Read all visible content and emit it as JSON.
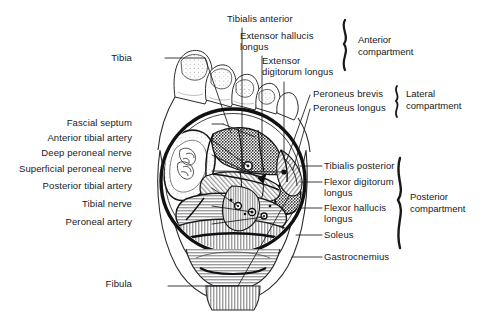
{
  "figure": {
    "type": "anatomical-cross-section",
    "background_color": "#ffffff",
    "ink_color": "#18181a"
  },
  "labels_left": [
    {
      "id": "tibia",
      "text": "Tibia",
      "x": 132,
      "y": 57
    },
    {
      "id": "fascial-septum",
      "text": "Fascial septum",
      "x": 135,
      "y": 122
    },
    {
      "id": "anterior-tibial-artery",
      "text": "Anterior tibial artery",
      "x": 135,
      "y": 137
    },
    {
      "id": "deep-peroneal-nerve",
      "text": "Deep peroneal nerve",
      "x": 135,
      "y": 152
    },
    {
      "id": "superficial-peroneal-nerve",
      "text": "Superficial peroneal nerve",
      "x": 135,
      "y": 168
    },
    {
      "id": "posterior-tibial-artery",
      "text": "Posterior tibial artery",
      "x": 135,
      "y": 185
    },
    {
      "id": "tibial-nerve",
      "text": "Tibial nerve",
      "x": 135,
      "y": 203
    },
    {
      "id": "peroneal-artery",
      "text": "Peroneal artery",
      "x": 135,
      "y": 221
    },
    {
      "id": "fibula",
      "text": "Fibula",
      "x": 132,
      "y": 283
    }
  ],
  "labels_top": [
    {
      "id": "tibialis-anterior",
      "text": "Tibialis anterior",
      "x": 227,
      "y": 17
    },
    {
      "id": "extensor-hallucis-longus",
      "text": "Extensor hallucis\nlongus",
      "x": 240,
      "y": 33
    },
    {
      "id": "extensor-digitorum-longus",
      "text": "Extensor\ndigitorum longus",
      "x": 262,
      "y": 58
    }
  ],
  "labels_right": [
    {
      "id": "peroneus-brevis",
      "text": "Peroneus brevis",
      "x": 313,
      "y": 91
    },
    {
      "id": "peroneus-longus",
      "text": "Peroneus longus",
      "x": 313,
      "y": 105
    },
    {
      "id": "tibialis-posterior",
      "text": "Tibialis posterior",
      "x": 325,
      "y": 162
    },
    {
      "id": "flexor-digitorum-longus",
      "text": "Flexor digitorum\nlongus",
      "x": 325,
      "y": 178
    },
    {
      "id": "flexor-hallucis-longus",
      "text": "Flexor hallucis\nlongus",
      "x": 325,
      "y": 204
    },
    {
      "id": "soleus",
      "text": "Soleus",
      "x": 325,
      "y": 231
    },
    {
      "id": "gastrocnemius",
      "text": "Gastrocnemius",
      "x": 325,
      "y": 253
    }
  ],
  "compartments": [
    {
      "id": "anterior-compartment",
      "text": "Anterior\ncompartment",
      "x": 360,
      "y": 40
    },
    {
      "id": "lateral-compartment",
      "text": "Lateral\ncompartment",
      "x": 408,
      "y": 93
    },
    {
      "id": "posterior-compartment",
      "text": "Posterior\ncompartment",
      "x": 412,
      "y": 197
    }
  ]
}
